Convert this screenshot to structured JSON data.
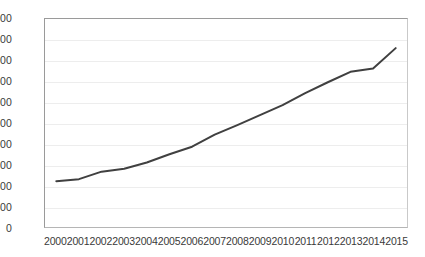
{
  "chart_data": {
    "type": "line",
    "title": "",
    "subtitle": "",
    "xlabel": "",
    "ylabel": "",
    "categories": [
      "2000",
      "2001",
      "2002",
      "2003",
      "2004",
      "2005",
      "2006",
      "2007",
      "2008",
      "2009",
      "2010",
      "2011",
      "2012",
      "2013",
      "2014",
      "2015"
    ],
    "values": [
      1100,
      1150,
      1330,
      1400,
      1550,
      1750,
      1930,
      2220,
      2450,
      2690,
      2930,
      3220,
      3480,
      3730,
      3810,
      4300
    ],
    "series": [
      {
        "name": "",
        "values": [
          1100,
          1150,
          1330,
          1400,
          1550,
          1750,
          1930,
          2220,
          2450,
          2690,
          2930,
          3220,
          3480,
          3730,
          3810,
          4300
        ]
      }
    ],
    "ylim": [
      0,
      5000
    ],
    "ytick_step": 500,
    "ytick_labels": [
      "5,000",
      "4,500",
      "4,000",
      "3,500",
      "3,000",
      "2,500",
      "2,000",
      "1,500",
      "1,000",
      "500",
      "0"
    ],
    "ytick_values": [
      5000,
      4500,
      4000,
      3500,
      3000,
      2500,
      2000,
      1500,
      1000,
      500,
      0
    ],
    "grid": true,
    "grid_axis": "y",
    "legend": false,
    "legend_position": "none",
    "markers": false,
    "line_color": "#404040",
    "grid_color": "#ededed",
    "axis_color": "#9a9a9a",
    "text_color": "#3a3a3a",
    "background_color": "#ffffff"
  }
}
